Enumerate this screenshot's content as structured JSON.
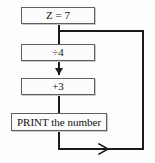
{
  "diagram": {
    "type": "flowchart",
    "background_color": "#fdfdfd",
    "box_border_color": "#5f5f5f",
    "line_color": "#1b1b1b",
    "nodes": [
      {
        "id": "start",
        "label": "Z = 7",
        "shape": "rectangle"
      },
      {
        "id": "divide",
        "label": "÷4",
        "shape": "rectangle"
      },
      {
        "id": "add",
        "label": "+3",
        "shape": "rectangle"
      },
      {
        "id": "print",
        "label": "PRINT the number",
        "shape": "rectangle"
      }
    ],
    "edges": [
      {
        "from": "start",
        "to": "divide",
        "arrow": false
      },
      {
        "from": "divide",
        "to": "add",
        "arrow": true,
        "direction": "down"
      },
      {
        "from": "add",
        "to": "print",
        "arrow": false
      },
      {
        "from": "print",
        "to": "divide",
        "arrow": true,
        "direction": "right",
        "style": "loop-back"
      }
    ]
  }
}
